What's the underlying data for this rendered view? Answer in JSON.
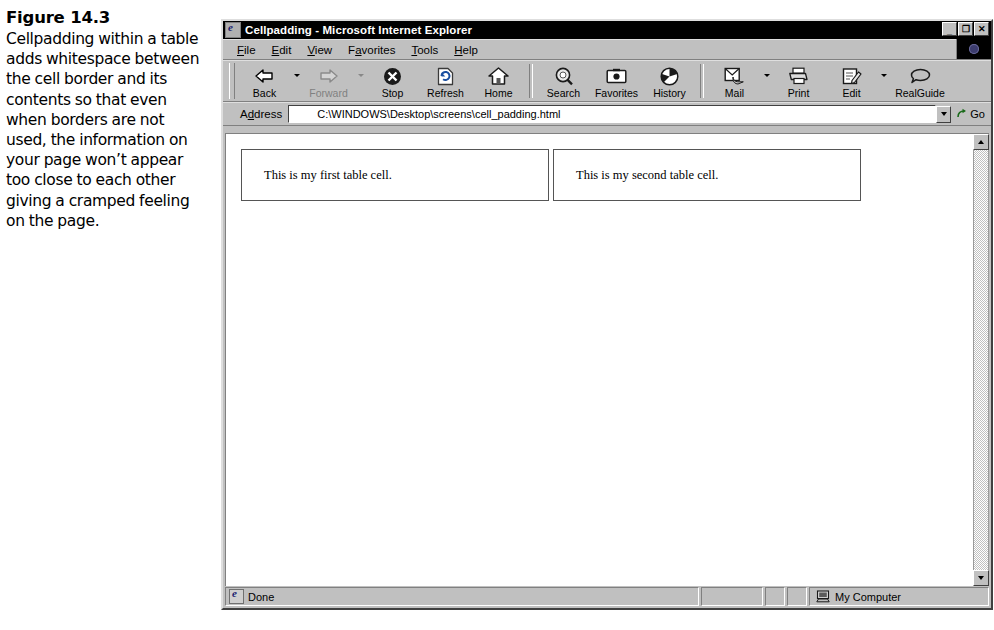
{
  "caption": {
    "figure_number": "Figure 14.3",
    "text": "Cellpadding within a table adds whitespace between the cell border and its contents so that even when borders are not used, the information on your page won’t appear too close to each other giving a cramped feeling on the page."
  },
  "browser": {
    "title": "Cellpadding - Microsoft Internet Explorer",
    "window_buttons": {
      "minimize": "_",
      "restore": "❐",
      "close": "✕"
    },
    "menu": [
      {
        "label": "File",
        "accel": "F"
      },
      {
        "label": "Edit",
        "accel": "E"
      },
      {
        "label": "View",
        "accel": "V"
      },
      {
        "label": "Favorites",
        "accel": "a"
      },
      {
        "label": "Tools",
        "accel": "T"
      },
      {
        "label": "Help",
        "accel": "H"
      }
    ],
    "toolbar": [
      {
        "label": "Back",
        "icon": "back-arrow-icon",
        "disabled": false,
        "dropdown": true
      },
      {
        "label": "Forward",
        "icon": "forward-arrow-icon",
        "disabled": true,
        "dropdown": true
      },
      {
        "label": "Stop",
        "icon": "stop-icon",
        "disabled": false,
        "dropdown": false
      },
      {
        "label": "Refresh",
        "icon": "refresh-icon",
        "disabled": false,
        "dropdown": false
      },
      {
        "label": "Home",
        "icon": "home-icon",
        "disabled": false,
        "dropdown": false
      },
      {
        "label": "Search",
        "icon": "search-icon",
        "disabled": false,
        "dropdown": false
      },
      {
        "label": "Favorites",
        "icon": "favorites-icon",
        "disabled": false,
        "dropdown": false
      },
      {
        "label": "History",
        "icon": "history-icon",
        "disabled": false,
        "dropdown": false
      },
      {
        "label": "Mail",
        "icon": "mail-icon",
        "disabled": false,
        "dropdown": true
      },
      {
        "label": "Print",
        "icon": "print-icon",
        "disabled": false,
        "dropdown": false
      },
      {
        "label": "Edit",
        "icon": "edit-icon",
        "disabled": false,
        "dropdown": true
      },
      {
        "label": "RealGuide",
        "icon": "realguide-icon",
        "disabled": false,
        "dropdown": false
      }
    ],
    "address": {
      "label": "Address",
      "value": "C:\\WINDOWS\\Desktop\\screens\\cell_padding.html",
      "go_label": "Go"
    },
    "status": {
      "text": "Done",
      "zone": "My Computer"
    }
  },
  "page": {
    "table": {
      "cells": [
        "This is my first table cell.",
        "This is my second table cell."
      ]
    }
  },
  "colors": {
    "window_face": "#c0c0c0",
    "titlebar": "#000000",
    "page_background": "#ffffff",
    "cell_border": "#555555"
  }
}
